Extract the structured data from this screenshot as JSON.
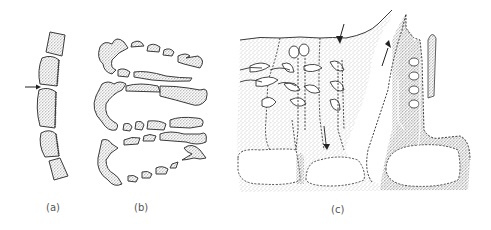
{
  "figure": {
    "colors": {
      "background": "#ffffff",
      "outline": "#3a3a3a",
      "stipple": "#7a7a7a",
      "stipple_dense": "#4a4a4a",
      "label": "#555555"
    },
    "panels": [
      {
        "id": "a",
        "label": "(a)",
        "content": "curved row of five separated stippled cell blocks with an arrow pointing at a gap"
      },
      {
        "id": "b",
        "label": "(b)",
        "content": "three horizontal U-shaped folds of segmented stippled tissue"
      },
      {
        "id": "c",
        "label": "(c)",
        "content": "two tissue masses with branched tree-like glandular ducts, dashed outlines, lumen cavities and arrows indicating flow direction"
      }
    ]
  }
}
